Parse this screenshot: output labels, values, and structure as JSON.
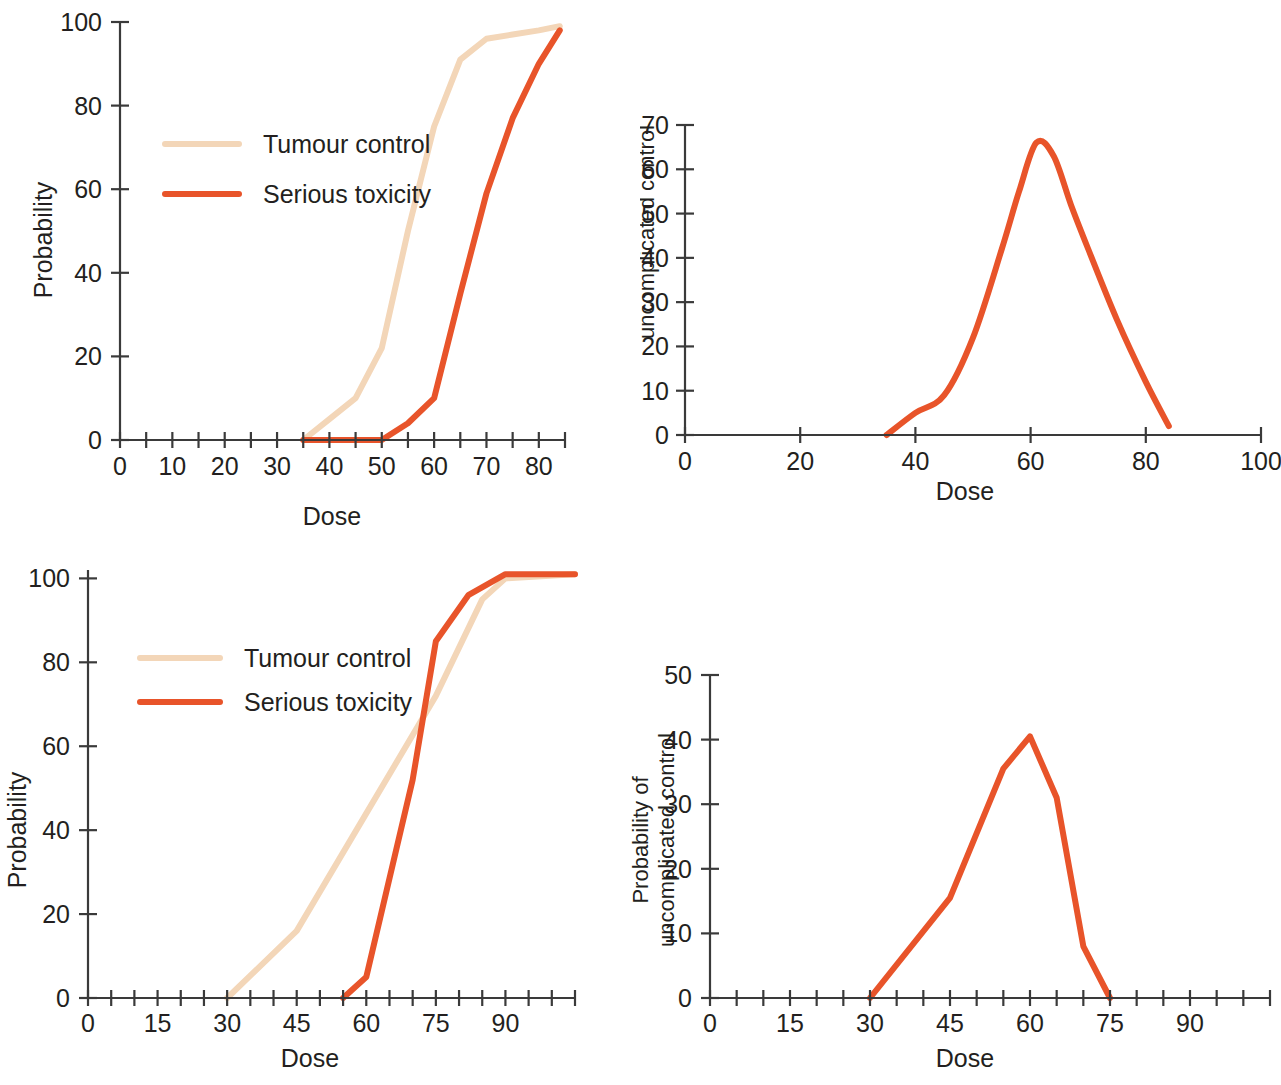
{
  "figure": {
    "colors": {
      "tumour_control": "#f3d6b8",
      "serious_toxicity": "#e8542a",
      "axis": "#3a3a3a",
      "text": "#231f20",
      "background": "#ffffff"
    },
    "legend": {
      "tumour_control_label": "Tumour control",
      "serious_toxicity_label": "Serious toxicity"
    }
  },
  "chart_data": [
    {
      "id": "top-left",
      "type": "line",
      "title": "",
      "xlabel": "Dose",
      "ylabel": "Probability",
      "xlim": [
        0,
        85
      ],
      "ylim": [
        0,
        100
      ],
      "xticks_major": [
        0,
        10,
        20,
        30,
        40,
        50,
        60,
        70,
        80
      ],
      "xticks_minor_step": 5,
      "yticks": [
        0,
        20,
        40,
        60,
        80,
        100
      ],
      "grid": false,
      "legend_position": "upper-left-inside",
      "series": [
        {
          "name": "Tumour control",
          "color": "#f3d6b8",
          "x": [
            35,
            40,
            45,
            50,
            55,
            60,
            65,
            70,
            75,
            80,
            84
          ],
          "values": [
            0,
            5,
            10,
            22,
            50,
            75,
            91,
            96,
            97,
            98,
            99
          ]
        },
        {
          "name": "Serious toxicity",
          "color": "#e8542a",
          "x": [
            35,
            40,
            45,
            50,
            55,
            60,
            65,
            70,
            75,
            80,
            84
          ],
          "values": [
            0,
            0,
            0,
            0,
            4,
            10,
            35,
            59,
            77,
            90,
            98
          ]
        }
      ]
    },
    {
      "id": "top-right",
      "type": "line",
      "title": "",
      "xlabel": "Dose",
      "ylabel": "Probability of\nuncomplicated control",
      "xlim": [
        0,
        100
      ],
      "ylim": [
        0,
        70
      ],
      "xticks_major": [
        0,
        20,
        40,
        60,
        80,
        100
      ],
      "yticks": [
        0,
        10,
        20,
        30,
        40,
        50,
        60,
        70
      ],
      "grid": false,
      "legend_position": "none",
      "series": [
        {
          "name": "Probability of uncomplicated control",
          "color": "#e8542a",
          "x": [
            35,
            40,
            45,
            50,
            55,
            58,
            61,
            64,
            67,
            70,
            75,
            80,
            84
          ],
          "values": [
            0,
            5,
            9,
            22,
            42,
            55,
            66,
            63,
            52,
            42,
            26,
            12,
            2
          ]
        }
      ]
    },
    {
      "id": "bottom-left",
      "type": "line",
      "title": "",
      "xlabel": "Dose",
      "ylabel": "Probability",
      "xlim": [
        0,
        105
      ],
      "ylim": [
        0,
        102
      ],
      "xticks_major": [
        0,
        15,
        30,
        45,
        60,
        75,
        90
      ],
      "xticks_minor_step": 5,
      "yticks": [
        0,
        20,
        40,
        60,
        80,
        100
      ],
      "grid": false,
      "legend_position": "upper-left-inside",
      "series": [
        {
          "name": "Tumour control",
          "color": "#f3d6b8",
          "x": [
            30,
            45,
            60,
            75,
            85,
            90,
            105
          ],
          "values": [
            0,
            16,
            44,
            72,
            95,
            100,
            101
          ]
        },
        {
          "name": "Serious toxicity",
          "color": "#e8542a",
          "x": [
            55,
            60,
            70,
            75,
            82,
            90,
            105
          ],
          "values": [
            0,
            5,
            52,
            85,
            96,
            101,
            101
          ]
        }
      ]
    },
    {
      "id": "bottom-right",
      "type": "line",
      "title": "",
      "xlabel": "Dose",
      "ylabel": "Probability of\nuncomplicated control",
      "xlim": [
        0,
        105
      ],
      "ylim": [
        0,
        50
      ],
      "xticks_major": [
        0,
        15,
        30,
        45,
        60,
        75,
        90
      ],
      "xticks_minor_step": 5,
      "yticks": [
        0,
        10,
        20,
        30,
        40,
        50
      ],
      "grid": false,
      "legend_position": "none",
      "series": [
        {
          "name": "Probability of uncomplicated control",
          "color": "#e8542a",
          "x": [
            30,
            45,
            55,
            60,
            65,
            70,
            75
          ],
          "values": [
            0,
            15.5,
            35.5,
            40.5,
            31,
            8,
            0
          ]
        }
      ]
    }
  ]
}
